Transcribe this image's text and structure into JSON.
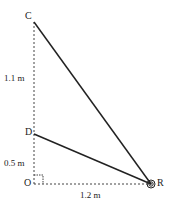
{
  "points": {
    "C": "C",
    "D": "D",
    "O": "O",
    "R": "R"
  },
  "measurements": {
    "oc_upper": "1.1 m",
    "od": "0.5 m",
    "or": "1.2 m"
  },
  "colors": {
    "line": "#222222",
    "dashed": "#444444"
  }
}
